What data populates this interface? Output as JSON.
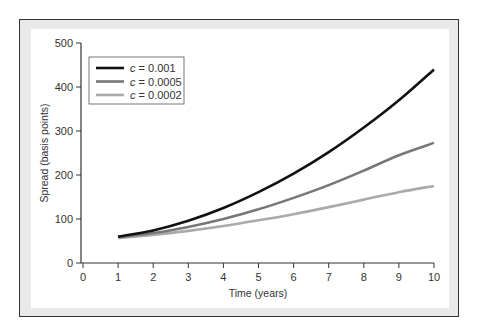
{
  "chart_data": {
    "type": "line",
    "title": "",
    "xlabel": "Time (years)",
    "ylabel": "Spread (basis points)",
    "xlim": [
      0,
      10
    ],
    "ylim": [
      0,
      500
    ],
    "x_ticks": [
      "0",
      "1",
      "2",
      "3",
      "4",
      "5",
      "6",
      "7",
      "8",
      "9",
      "10"
    ],
    "y_ticks": [
      "0",
      "100",
      "200",
      "300",
      "400",
      "500"
    ],
    "grid": false,
    "legend_position": "upper left",
    "x": [
      1,
      2,
      3,
      4,
      5,
      6,
      7,
      8,
      9,
      10
    ],
    "series": [
      {
        "name": "c = 0.001",
        "label_var": "c",
        "label_val": " = 0.001",
        "color": "#111111",
        "values": [
          60,
          74,
          96,
          125,
          161,
          203,
          252,
          308,
          370,
          440
        ]
      },
      {
        "name": "c = 0.0005",
        "label_var": "c",
        "label_val": " = 0.0005",
        "color": "#777777",
        "values": [
          59,
          68,
          82,
          100,
          122,
          148,
          177,
          210,
          245,
          273
        ]
      },
      {
        "name": "c = 0.0002",
        "label_var": "c",
        "label_val": " = 0.0002",
        "color": "#aaaaaa",
        "values": [
          57,
          64,
          73,
          84,
          97,
          111,
          127,
          144,
          161,
          175
        ]
      }
    ]
  }
}
